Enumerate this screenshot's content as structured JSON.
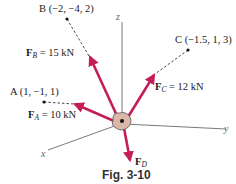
{
  "colors": {
    "force": "#c41e5a",
    "axis": "#6a6a6a",
    "dashed": "#333333",
    "ring_fill": "#d9b8a8",
    "ring_stroke": "#555555"
  },
  "axes": {
    "x": "x",
    "y": "y",
    "z": "z"
  },
  "points": {
    "A": "A (1, −1, 1)",
    "B": "B (−2, −4, 2)",
    "C": "C (−1.5, 1, 3)"
  },
  "forces": {
    "FA": {
      "symbol": "F",
      "sub": "A",
      "value": " = 10 kN"
    },
    "FB": {
      "symbol": "F",
      "sub": "B",
      "value": " = 15 kN"
    },
    "FC": {
      "symbol": "F",
      "sub": "C",
      "value": " = 12 kN"
    },
    "FD": {
      "symbol": "F",
      "sub": "D",
      "value": ""
    }
  },
  "caption": "Fig. 3-10"
}
